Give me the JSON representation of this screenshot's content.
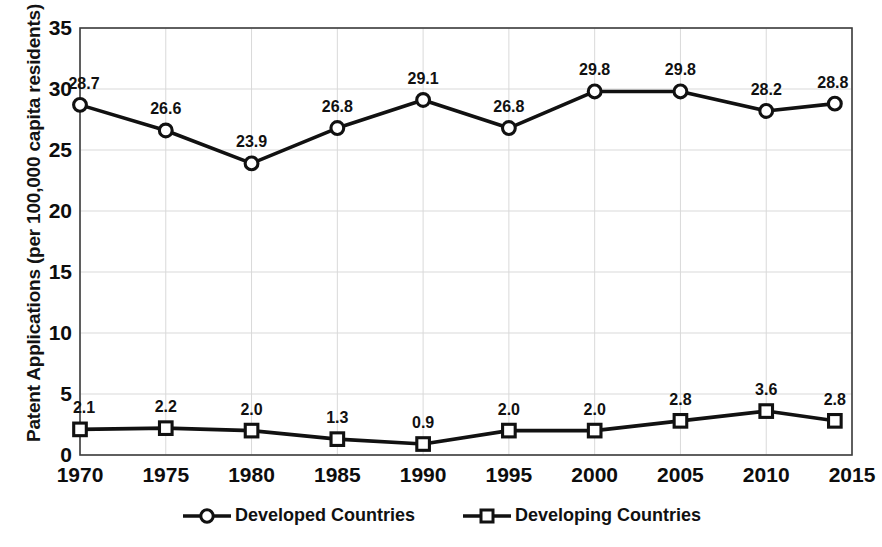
{
  "chart_data": {
    "type": "line",
    "title": "",
    "xlabel": "",
    "ylabel": "Patent Applications (per 100,000 capita residents)",
    "x": [
      1970,
      1975,
      1980,
      1985,
      1990,
      1995,
      2000,
      2005,
      2010,
      2014
    ],
    "categories": [
      "1970",
      "1975",
      "1980",
      "1985",
      "1990",
      "1995",
      "2000",
      "2005",
      "2010",
      "2014"
    ],
    "series": [
      {
        "name": "Developed Countries",
        "marker": "circle",
        "values": [
          28.7,
          26.6,
          23.9,
          26.8,
          29.1,
          26.8,
          29.8,
          29.8,
          28.2,
          28.8
        ],
        "labels": [
          "28.7",
          "26.6",
          "23.9",
          "26.8",
          "29.1",
          "26.8",
          "29.8",
          "29.8",
          "28.2",
          "28.8"
        ]
      },
      {
        "name": "Developing Countries",
        "marker": "square",
        "values": [
          2.1,
          2.2,
          2.0,
          1.3,
          0.9,
          2.0,
          2.0,
          2.8,
          3.6,
          2.8
        ],
        "labels": [
          "2.1",
          "2.2",
          "2.0",
          "1.3",
          "0.9",
          "2.0",
          "2.0",
          "2.8",
          "3.6",
          "2.8"
        ]
      }
    ],
    "xlim": [
      1970,
      2015
    ],
    "ylim": [
      0,
      35
    ],
    "yticks": [
      "0",
      "5",
      "10",
      "15",
      "20",
      "25",
      "30",
      "35"
    ],
    "xticks": [
      "1970",
      "1975",
      "1980",
      "1985",
      "1990",
      "1995",
      "2000",
      "2005",
      "2010",
      "2015"
    ],
    "grid": true,
    "legend_position": "bottom",
    "colors": {
      "line": "#111111",
      "marker_fill": "#ffffff",
      "grid": "#d9d9d9",
      "axis": "#444444",
      "text": "#111111"
    }
  },
  "axis": {
    "y_title": "Patent Applications (per 100,000 capita residents)",
    "y_ticks": [
      "35",
      "30",
      "25",
      "20",
      "15",
      "10",
      "5",
      "0"
    ],
    "x_ticks": [
      "1970",
      "1975",
      "1980",
      "1985",
      "1990",
      "1995",
      "2000",
      "2005",
      "2010",
      "2015"
    ]
  },
  "legend": {
    "items": [
      {
        "label": "Developed Countries",
        "marker": "circle-marker-icon"
      },
      {
        "label": "Developing Countries",
        "marker": "square-marker-icon"
      }
    ]
  },
  "data_labels": {
    "developed": [
      "28.7",
      "26.6",
      "23.9",
      "26.8",
      "29.1",
      "26.8",
      "29.8",
      "29.8",
      "28.2",
      "28.8"
    ],
    "developing": [
      "2.1",
      "2.2",
      "2.0",
      "1.3",
      "0.9",
      "2.0",
      "2.0",
      "2.8",
      "3.6",
      "2.8"
    ]
  }
}
